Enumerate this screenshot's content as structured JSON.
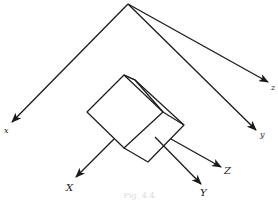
{
  "figure": {
    "caption": "Fig. 4.4",
    "colors": {
      "stroke": "#1a1a1a",
      "background": "#ffffff"
    },
    "world_axes": {
      "origin": [
        128,
        4
      ],
      "labels": {
        "x": "x",
        "y": "y",
        "z": "z"
      }
    },
    "body_axes": {
      "labels": {
        "x": "X",
        "y": "Y",
        "z": "Z"
      }
    },
    "object": "cube"
  }
}
